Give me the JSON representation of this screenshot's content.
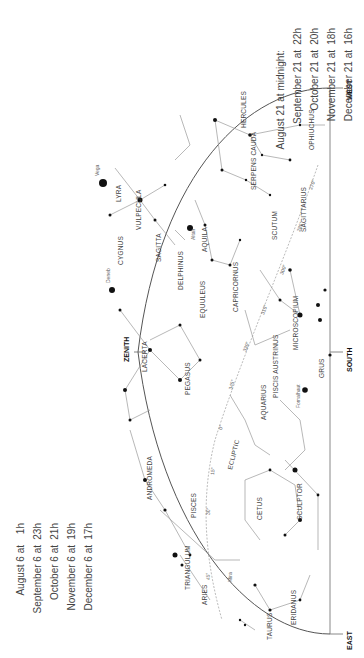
{
  "directions": {
    "west": "WEST",
    "south": "SOUTH",
    "east": "EAST",
    "zenith": "ZENITH"
  },
  "table_top": {
    "rows": [
      {
        "date": "August 21 at midnight:",
        "time": ""
      },
      {
        "date": "September 21 at",
        "time": "22h"
      },
      {
        "date": "October 21 at",
        "time": "20h"
      },
      {
        "date": "November 21 at",
        "time": "18h"
      },
      {
        "date": "December 21 at",
        "time": "16h"
      }
    ]
  },
  "table_bottom": {
    "rows": [
      {
        "date": "August 6 at",
        "time": "1h"
      },
      {
        "date": "September 6 at",
        "time": "23h"
      },
      {
        "date": "October 6 at",
        "time": "21h"
      },
      {
        "date": "November 6 at",
        "time": "19h"
      },
      {
        "date": "December 6 at",
        "time": "17h"
      }
    ]
  },
  "constellations": [
    "HERCULES",
    "OPHIUCHUS",
    "SERPENS CAUDA",
    "SCUTUM",
    "SAGITTARIUS",
    "LYRA",
    "VULPECULA",
    "CYGNUS",
    "SAGITTA",
    "AQUILA",
    "DELPHINUS",
    "CAPRICORNUS",
    "EQUULEUS",
    "MICROSCOPIUM",
    "LACERTA",
    "PEGASUS",
    "PISCIS AUSTRINUS",
    "GRUS",
    "AQUARIUS",
    "ANDROMEDA",
    "PISCES",
    "CETUS",
    "SCULPTOR",
    "TRIANGULUM",
    "ARIES",
    "ERIDANUS",
    "TAURUS"
  ],
  "stars": [
    "Vega",
    "Deneb",
    "Altair",
    "Fomalhaut",
    "Mira"
  ],
  "ecliptic_label": "ECLIPTIC",
  "degree_marks": [
    "270°",
    "285°",
    "300°",
    "315°",
    "330°",
    "345°",
    "0°",
    "15°",
    "30°",
    "45°"
  ]
}
